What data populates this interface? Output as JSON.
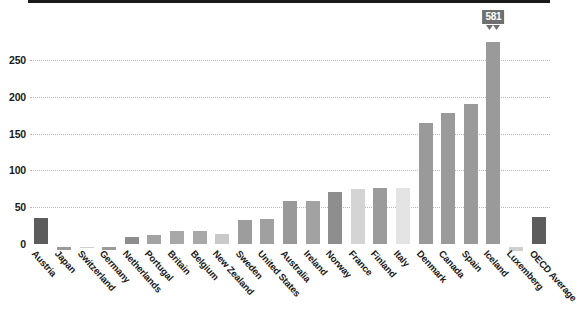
{
  "chart_data": {
    "type": "bar",
    "title": "",
    "subtitle": "",
    "xlabel": "",
    "ylabel": "",
    "ylim": [
      -10,
      275
    ],
    "grid": true,
    "legend": "none",
    "yticks": [
      0,
      50,
      100,
      150,
      200,
      250
    ],
    "ytick_labels": [
      "0",
      "50",
      "100",
      "150",
      "200",
      "250"
    ],
    "categories": [
      "Austria",
      "Japan",
      "Switzerland",
      "Germany",
      "Netherlands",
      "Portugal",
      "Britain",
      "Belgium",
      "New Zealand",
      "Sweden",
      "United States",
      "Australia",
      "Ireland",
      "Norway",
      "France",
      "Finland",
      "Italy",
      "Denmark",
      "Canada",
      "Spain",
      "Iceland",
      "Luxemberg",
      "OECD Average"
    ],
    "values": [
      36,
      -4,
      -2,
      -4,
      10,
      12,
      18,
      18,
      14,
      32,
      34,
      58,
      58,
      70,
      75,
      76,
      76,
      165,
      178,
      190,
      581,
      -5,
      37
    ],
    "bar_colors": [
      "#5c5c5c",
      "#9a9a9a",
      "#cfcfcf",
      "#9a9a9a",
      "#8d8d8d",
      "#a3a3a3",
      "#a8a8a8",
      "#a8a8a8",
      "#c9c9c9",
      "#9d9d9d",
      "#a0a0a0",
      "#999999",
      "#a2a2a2",
      "#8e8e8e",
      "#d4d4d4",
      "#9b9b9b",
      "#e4e4e4",
      "#9a9a9a",
      "#9a9a9a",
      "#9a9a9a",
      "#9a9a9a",
      "#d0d0d0",
      "#5c5c5c"
    ],
    "broken_bar": {
      "category": "Iceland",
      "value": 581,
      "label": "581",
      "label_color": "#6f6f6f",
      "note": "bar axis-broken with zigzag cap; true value shown in callout box"
    },
    "annotations": [
      {
        "text": "581",
        "attached_to": "Iceland"
      }
    ],
    "colors": {
      "axis": "#1a1a1a",
      "grid": "#b9b9b9",
      "background": "#ffffff",
      "highlight_bar": "#5c5c5c",
      "default_bar": "#9a9a9a"
    }
  },
  "source_note": ""
}
